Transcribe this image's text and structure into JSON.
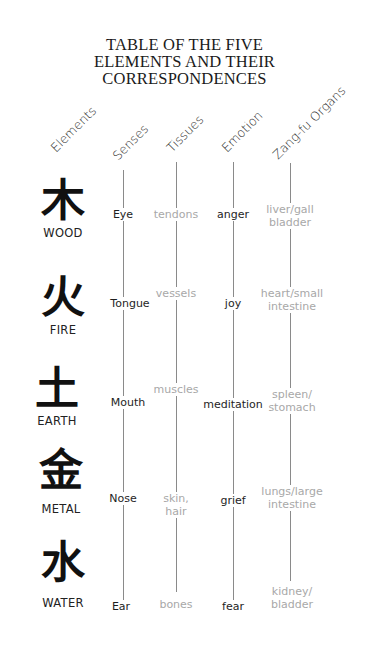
{
  "title": {
    "line1": "TABLE OF THE FIVE",
    "line2": "ELEMENTS AND THEIR",
    "line3": "CORRESPONDENCES"
  },
  "headers": [
    "Elements",
    "Senses",
    "Tissues",
    "Emotion",
    "Zang-fu Organs"
  ],
  "rows": [
    {
      "glyph": "木",
      "element": "WOOD",
      "sense": "Eye",
      "tissue": "tendons",
      "emotion": "anger",
      "organ_line1": "liver/gall",
      "organ_line2": "bladder"
    },
    {
      "glyph": "火",
      "element": "FIRE",
      "sense": "Tongue",
      "tissue": "vessels",
      "emotion": "joy",
      "organ_line1": "heart/small",
      "organ_line2": "intestine"
    },
    {
      "glyph": "土",
      "element": "EARTH",
      "sense": "Mouth",
      "tissue": "muscles",
      "emotion": "meditation",
      "organ_line1": "spleen/",
      "organ_line2": "stomach"
    },
    {
      "glyph": "金",
      "element": "METAL",
      "sense": "Nose",
      "tissue_line1": "skin,",
      "tissue_line2": "hair",
      "emotion": "grief",
      "organ_line1": "lungs/large",
      "organ_line2": "intestine"
    },
    {
      "glyph": "水",
      "element": "WATER",
      "sense": "Ear",
      "tissue": "bones",
      "emotion": "fear",
      "organ_line1": "kidney/",
      "organ_line2": "bladder"
    }
  ],
  "colors": {
    "dark_text": "#1e1e1e",
    "light_text": "#a8a8a8",
    "line": "#8a8a8a"
  }
}
